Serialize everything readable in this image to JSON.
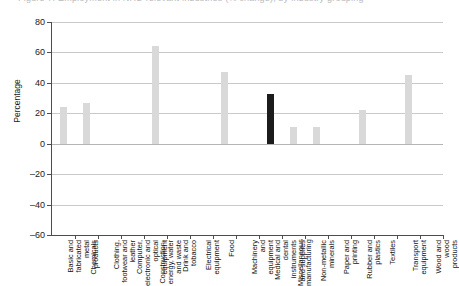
{
  "title_partial": "Figure 7: Employment in NHS-relevant industries (% change), by industry grouping",
  "axis": {
    "ylabel": "Percentage",
    "yticks": [
      "80",
      "60",
      "40",
      "20",
      "0",
      "-20",
      "-40",
      "-60"
    ],
    "ymin": -60,
    "ymax": 80
  },
  "colors": {
    "bar": "#d9d9d9",
    "bar_highlight": "#1c1c1c",
    "grid": "#c9c9c9",
    "axis": "#4d4d4d"
  },
  "chart_data": {
    "type": "bar",
    "title": "Figure 7: Employment in NHS-relevant industries (% change), by industry grouping",
    "xlabel": "",
    "ylabel": "Percentage",
    "ylim": [
      -60,
      80
    ],
    "yticks": [
      -60,
      -40,
      -20,
      0,
      20,
      40,
      60,
      80
    ],
    "grid": true,
    "legend": "none",
    "highlight_category": "Medical and dental instruments and supplies",
    "categories": [
      "Basic and fabricated metal products",
      "Chemicals",
      "Clothing, footwear and leather",
      "Computer, electronic and optical equipment",
      "Construction, energy, water and waste",
      "Drink and tobacco",
      "Electrical equipment",
      "Food",
      "Machinery and equipment",
      "Medical and dental instruments and supplies",
      "Miscellaneous manufacturing",
      "Non-metallic minerals",
      "Paper and printing",
      "Rubber and plastics",
      "Textiles",
      "Transport equipment",
      "Wood and wood products"
    ],
    "values": [
      24,
      27,
      0,
      0,
      64,
      0,
      0,
      47,
      0,
      33,
      11,
      11,
      0,
      22,
      0,
      45,
      0
    ]
  }
}
